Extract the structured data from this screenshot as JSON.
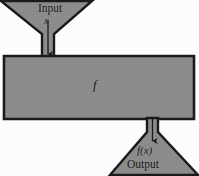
{
  "diagram": {
    "colors": {
      "body_fill": "#8c8c8c",
      "outline": "#1a1a1a",
      "background": "#fdfdfd",
      "text": "#111111",
      "arrow": "#1a1a1a"
    },
    "input_funnel": {
      "label": "Input",
      "variable": "x",
      "arrow_icon": "down-arrow-icon"
    },
    "body": {
      "label": "f"
    },
    "output_funnel": {
      "label": "Output",
      "expression": "f(x)",
      "arrow_icon": "down-arrow-icon"
    }
  }
}
